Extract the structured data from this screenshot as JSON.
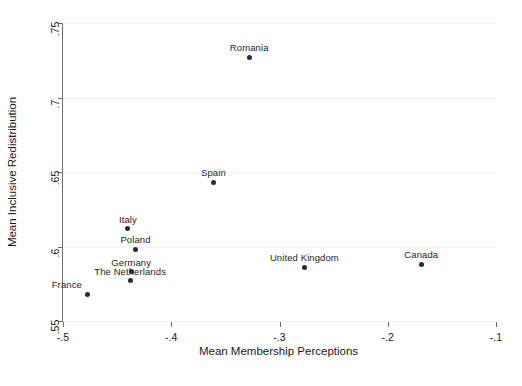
{
  "chart_data": {
    "type": "scatter",
    "title": "",
    "xlabel": "Mean Membership Perceptions",
    "ylabel": "Mean Inclusive Redistribution",
    "xlim": [
      -0.5,
      -0.1
    ],
    "ylim": [
      0.55,
      0.75
    ],
    "xticks": [
      -0.5,
      -0.4,
      -0.3,
      -0.2,
      -0.1
    ],
    "xticklabels": [
      "-.5",
      "-.4",
      "-.3",
      "-.2",
      "-.1"
    ],
    "yticks": [
      0.55,
      0.6,
      0.65,
      0.7,
      0.75
    ],
    "yticklabels": [
      ".55",
      ".6",
      ".65",
      ".7",
      ".75"
    ],
    "grid": "horizontal",
    "legend": "none",
    "marker_color": "#2b2b2b",
    "gridline_color": "#f2f2f2",
    "axis_color": "#6e6e6e",
    "points": [
      {
        "label": "Romania",
        "x": -0.328,
        "y": 0.727,
        "label_pos": "above"
      },
      {
        "label": "Spain",
        "x": -0.361,
        "y": 0.643,
        "label_pos": "above"
      },
      {
        "label": "Italy",
        "x": -0.44,
        "y": 0.612,
        "label_pos": "above"
      },
      {
        "label": "Poland",
        "x": -0.433,
        "y": 0.598,
        "label_pos": "above"
      },
      {
        "label": "Germany",
        "x": -0.437,
        "y": 0.583,
        "label_pos": "above"
      },
      {
        "label": "The Netherlands",
        "x": -0.438,
        "y": 0.577,
        "label_pos": "above"
      },
      {
        "label": "France",
        "x": -0.477,
        "y": 0.568,
        "label_pos": "above-left"
      },
      {
        "label": "United Kingdom",
        "x": -0.277,
        "y": 0.586,
        "label_pos": "above"
      },
      {
        "label": "Canada",
        "x": -0.169,
        "y": 0.588,
        "label_pos": "above"
      }
    ]
  }
}
